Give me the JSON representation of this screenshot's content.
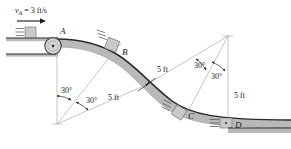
{
  "figure": {
    "name": "curved-ramp-dynamics-figure",
    "velocity_label": {
      "symbol": "v",
      "subscript": "A",
      "equals": "=",
      "value": "3",
      "units": "ft/s",
      "full": "vA = 3 ft/s"
    },
    "points": [
      {
        "id": "A",
        "label": "A",
        "x": 60,
        "y": 34
      },
      {
        "id": "B",
        "label": "B",
        "x": 120,
        "y": 52
      },
      {
        "id": "C",
        "label": "C",
        "x": 187,
        "y": 117
      },
      {
        "id": "D",
        "label": "D",
        "x": 234,
        "y": 128
      }
    ],
    "radii": [
      {
        "label": "5 ft",
        "x": 113,
        "y": 98,
        "rotate": -28
      },
      {
        "label": "5 ft",
        "x": 165,
        "y": 70,
        "rotate": -27
      },
      {
        "label": "5 ft",
        "x": 228,
        "y": 96,
        "rotate": 0
      }
    ],
    "angles": [
      {
        "label": "30°",
        "x": 63,
        "y": 92
      },
      {
        "label": "30°",
        "x": 88,
        "y": 100
      },
      {
        "label": "30°",
        "x": 199,
        "y": 66
      },
      {
        "label": "30°",
        "x": 217,
        "y": 74
      }
    ],
    "colors": {
      "surface_fill": "#b9b9b9",
      "surface_edge": "#2a2a2a",
      "block_fill": "#c9c9c9",
      "block_edge": "#6a6a6a",
      "thin_line": "#8a8a8a",
      "text": "#1a1a1a",
      "ground_fill": "#b9b9b9"
    }
  }
}
